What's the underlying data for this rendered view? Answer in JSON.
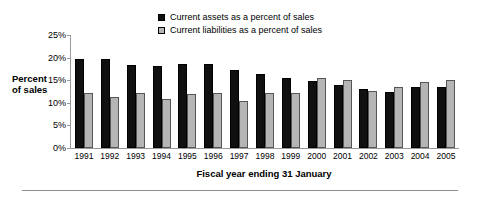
{
  "chart_data": {
    "type": "bar",
    "title": "",
    "xlabel": "Fiscal year ending 31 January",
    "ylabel": "Percent of sales",
    "ylabel_lines": [
      "Percent",
      "of sales"
    ],
    "categories": [
      "1991",
      "1992",
      "1993",
      "1994",
      "1995",
      "1996",
      "1997",
      "1998",
      "1999",
      "2000",
      "2001",
      "2002",
      "2003",
      "2004",
      "2005"
    ],
    "series": [
      {
        "name": "Current assets as a percent of sales",
        "color": "#101010",
        "values": [
          19.7,
          19.7,
          18.4,
          18.1,
          18.6,
          18.6,
          17.2,
          16.4,
          15.4,
          14.9,
          14.0,
          13.0,
          12.5,
          13.6,
          13.6
        ]
      },
      {
        "name": "Current liabilities as a percent of sales",
        "color": "#b5b5b5",
        "values": [
          12.2,
          11.2,
          12.2,
          10.9,
          12.0,
          12.2,
          10.4,
          12.2,
          12.2,
          15.6,
          15.1,
          12.6,
          13.4,
          14.7,
          15.1
        ]
      }
    ],
    "ylim": [
      0,
      25
    ],
    "yticks": [
      0,
      5,
      10,
      15,
      20,
      25
    ],
    "ytick_labels": [
      "0%",
      "5%",
      "10%",
      "15%",
      "20%",
      "25%"
    ],
    "grid": false,
    "legend_position": "top-center"
  },
  "legend": {
    "entries": [
      {
        "label": "Current assets as a percent of sales",
        "swatch": "series-assets"
      },
      {
        "label": "Current liabilities as a percent of sales",
        "swatch": "series-liabilities"
      }
    ]
  }
}
